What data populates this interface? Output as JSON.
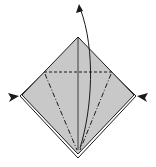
{
  "diagram": {
    "type": "origami-fold-step",
    "colors": {
      "paper_fill": "#c8c8c8",
      "line": "#1a1a1a",
      "background": "#ffffff"
    },
    "elements": {
      "paper": "square-diamond",
      "valley_fold_line": "horizontal dashed line",
      "mountain_fold_lines": "two dash-dot diagonal lines",
      "center_crease": "vertical solid line",
      "lift_arrow": "curved arrow upward",
      "push_arrows": [
        "left-push-arrow",
        "right-push-arrow"
      ]
    }
  }
}
